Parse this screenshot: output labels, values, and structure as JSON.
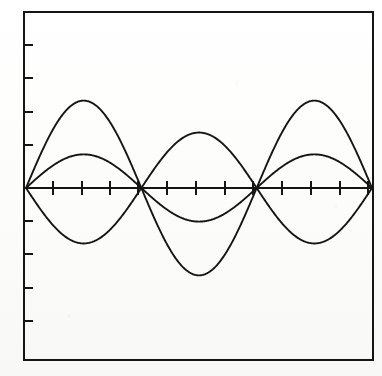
{
  "figure": {
    "title": "",
    "caption": "",
    "background_color": "#fdfdfc",
    "ink_color": "#151515"
  },
  "frame": {
    "left": 24,
    "top": 12,
    "right": 373,
    "bottom": 360,
    "border_color": "#151515",
    "border_width": 2.2,
    "name": "plot-frame"
  },
  "axis": {
    "x_axis_y": 188,
    "x_axis_left": 26,
    "x_axis_right": 372,
    "axis_color": "#151515",
    "axis_width": 1.8,
    "x_tick_count": 12,
    "x_tick_half_length": 7,
    "y_tick_count": 8,
    "y_tick_length": 7,
    "y_tick_spacing": 33,
    "x_tick_positions": [
      53,
      82,
      110,
      138,
      167,
      196,
      225,
      253,
      282,
      311,
      340,
      368
    ],
    "y_tick_positions": [
      45,
      78,
      112,
      145,
      221,
      254,
      288,
      321
    ]
  },
  "chart_data": {
    "type": "line",
    "title": "",
    "subtitle": "",
    "xlabel": "",
    "ylabel": "",
    "xlim": [
      0,
      1
    ],
    "ylim": [
      -1,
      1
    ],
    "grid": false,
    "legend": false,
    "legend_position": "none",
    "annotations": [],
    "x_tick_labels": [],
    "y_tick_labels": [],
    "node_x_fractions": [
      0.0,
      0.3295,
      0.6705,
      1.0
    ],
    "series": [
      {
        "name": "harmonic-large",
        "amplitude": 0.52,
        "cycles": 1.5,
        "phase_sign": 1,
        "stroke_width": 1.9,
        "color": "#151515",
        "peaks": [
          {
            "x_frac": 0.167,
            "y_value": 0.52
          },
          {
            "x_frac": 0.833,
            "y_value": 0.52
          }
        ],
        "troughs": [
          {
            "x_frac": 0.5,
            "y_value": -0.52
          }
        ],
        "x": [
          0,
          0.042,
          0.083,
          0.125,
          0.167,
          0.208,
          0.25,
          0.292,
          0.33,
          0.375,
          0.417,
          0.458,
          0.5,
          0.542,
          0.583,
          0.625,
          0.67,
          0.708,
          0.75,
          0.792,
          0.833,
          0.875,
          0.917,
          0.958,
          1.0
        ],
        "values": [
          0,
          0.2,
          0.37,
          0.48,
          0.52,
          0.48,
          0.37,
          0.2,
          0,
          -0.2,
          -0.37,
          -0.48,
          -0.52,
          -0.48,
          -0.37,
          -0.2,
          0,
          0.2,
          0.37,
          0.48,
          0.52,
          0.48,
          0.37,
          0.2,
          0
        ]
      },
      {
        "name": "harmonic-medium",
        "amplitude": 0.33,
        "cycles": 1.5,
        "phase_sign": -1,
        "stroke_width": 1.9,
        "color": "#151515",
        "peaks": [
          {
            "x_frac": 0.5,
            "y_value": 0.33
          }
        ],
        "troughs": [
          {
            "x_frac": 0.167,
            "y_value": -0.33
          },
          {
            "x_frac": 0.833,
            "y_value": -0.33
          }
        ],
        "x": [
          0,
          0.042,
          0.083,
          0.125,
          0.167,
          0.208,
          0.25,
          0.292,
          0.33,
          0.375,
          0.417,
          0.458,
          0.5,
          0.542,
          0.583,
          0.625,
          0.67,
          0.708,
          0.75,
          0.792,
          0.833,
          0.875,
          0.917,
          0.958,
          1.0
        ],
        "values": [
          0,
          -0.13,
          -0.23,
          -0.3,
          -0.33,
          -0.3,
          -0.23,
          -0.13,
          0,
          0.13,
          0.23,
          0.3,
          0.33,
          0.3,
          0.23,
          0.13,
          0,
          -0.13,
          -0.23,
          -0.3,
          -0.33,
          -0.3,
          -0.23,
          -0.13,
          0
        ]
      },
      {
        "name": "harmonic-small",
        "amplitude": 0.2,
        "cycles": 1.5,
        "phase_sign": 1,
        "stroke_width": 1.9,
        "color": "#151515",
        "peaks": [
          {
            "x_frac": 0.167,
            "y_value": 0.2
          },
          {
            "x_frac": 0.833,
            "y_value": 0.2
          }
        ],
        "troughs": [
          {
            "x_frac": 0.5,
            "y_value": -0.2
          }
        ],
        "x": [
          0,
          0.042,
          0.083,
          0.125,
          0.167,
          0.208,
          0.25,
          0.292,
          0.33,
          0.375,
          0.417,
          0.458,
          0.5,
          0.542,
          0.583,
          0.625,
          0.67,
          0.708,
          0.75,
          0.792,
          0.833,
          0.875,
          0.917,
          0.958,
          1.0
        ],
        "values": [
          0,
          0.077,
          0.142,
          0.185,
          0.2,
          0.185,
          0.142,
          0.077,
          0,
          -0.077,
          -0.142,
          -0.185,
          -0.2,
          -0.185,
          -0.142,
          -0.077,
          0,
          0.077,
          0.142,
          0.185,
          0.2,
          0.185,
          0.142,
          0.077,
          0
        ]
      }
    ]
  }
}
